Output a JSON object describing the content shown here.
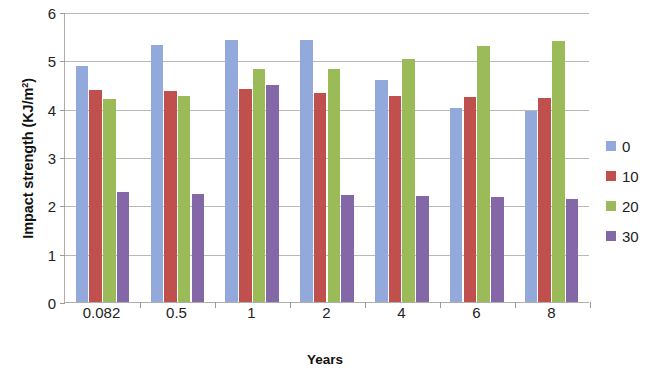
{
  "chart_data": {
    "type": "bar",
    "title": "",
    "xlabel": "Years",
    "ylabel": "Impact strength (KJ/m",
    "ylabel_sup": "2",
    "ylabel_suffix": ")",
    "categories": [
      "0.082",
      "0.5",
      "1",
      "2",
      "4",
      "6",
      "8"
    ],
    "ylim": [
      0,
      6
    ],
    "yticks": [
      0,
      1,
      2,
      3,
      4,
      5,
      6
    ],
    "ytick_labels": [
      "0",
      "1",
      "2",
      "3",
      "4",
      "5",
      "6"
    ],
    "grid": true,
    "legend_position": "right",
    "series": [
      {
        "name": "0",
        "color": "#93a9dc",
        "values": [
          4.88,
          5.32,
          5.42,
          5.42,
          4.6,
          4.02,
          3.95
        ]
      },
      {
        "name": "10",
        "color": "#c0504d",
        "values": [
          4.38,
          4.37,
          4.4,
          4.33,
          4.27,
          4.25,
          4.22
        ]
      },
      {
        "name": "20",
        "color": "#9bbb59",
        "values": [
          4.2,
          4.26,
          4.83,
          4.82,
          5.03,
          5.3,
          5.4
        ]
      },
      {
        "name": "30",
        "color": "#8367a6",
        "values": [
          2.27,
          2.24,
          4.48,
          2.21,
          2.19,
          2.17,
          2.13
        ]
      }
    ]
  }
}
